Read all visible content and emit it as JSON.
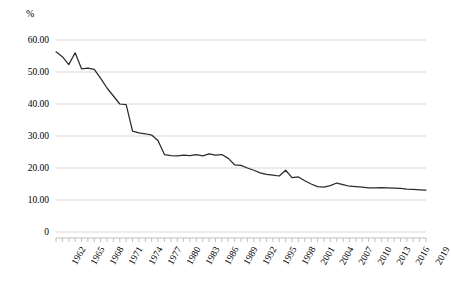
{
  "chart": {
    "unit_label": "%",
    "axis": {
      "y_ticks": [
        "0",
        "10.00",
        "20.00",
        "30.00",
        "40.00",
        "50.00",
        "60.00"
      ],
      "x_ticks": [
        "1962",
        "1965",
        "1968",
        "1971",
        "1974",
        "1977",
        "1980",
        "1983",
        "1986",
        "1989",
        "1992",
        "1995",
        "1998",
        "2001",
        "2004",
        "2007",
        "2010",
        "2013",
        "2016",
        "2019"
      ]
    },
    "line_color": "#2b2b2b",
    "grid_color": "#d9d9d9",
    "axis_color": "#bfbfbf"
  },
  "chart_data": {
    "type": "line",
    "title": "",
    "xlabel": "",
    "ylabel": "%",
    "ylim": [
      0,
      60
    ],
    "xlim": [
      1962,
      2020
    ],
    "grid": true,
    "legend": false,
    "y_tick_values": [
      0,
      10,
      20,
      30,
      40,
      50,
      60
    ],
    "x_tick_labels": [
      "1962",
      "1965",
      "1968",
      "1971",
      "1974",
      "1977",
      "1980",
      "1983",
      "1986",
      "1989",
      "1992",
      "1995",
      "1998",
      "2001",
      "2004",
      "2007",
      "2010",
      "2013",
      "2016",
      "2019"
    ],
    "x": [
      1962,
      1963,
      1964,
      1965,
      1966,
      1967,
      1968,
      1969,
      1970,
      1971,
      1972,
      1973,
      1974,
      1975,
      1976,
      1977,
      1978,
      1979,
      1980,
      1981,
      1982,
      1983,
      1984,
      1985,
      1986,
      1987,
      1988,
      1989,
      1990,
      1991,
      1992,
      1993,
      1994,
      1995,
      1996,
      1997,
      1998,
      1999,
      2000,
      2001,
      2002,
      2003,
      2004,
      2005,
      2006,
      2007,
      2008,
      2009,
      2010,
      2011,
      2012,
      2013,
      2014,
      2015,
      2016,
      2017,
      2018,
      2019,
      2020
    ],
    "series": [
      {
        "name": "Share",
        "values": [
          56.3,
          54.8,
          52.3,
          56.0,
          51.0,
          51.2,
          50.8,
          48.0,
          45.0,
          42.5,
          40.0,
          39.8,
          31.5,
          31.0,
          30.7,
          30.3,
          28.5,
          24.2,
          23.9,
          23.8,
          24.0,
          23.9,
          24.2,
          23.8,
          24.4,
          24.0,
          24.2,
          23.0,
          21.0,
          20.8,
          20.0,
          19.3,
          18.5,
          18.0,
          17.8,
          17.5,
          19.3,
          17.0,
          17.2,
          16.0,
          15.0,
          14.2,
          14.0,
          14.5,
          15.3,
          14.8,
          14.3,
          14.2,
          14.0,
          13.8,
          13.8,
          13.9,
          13.8,
          13.7,
          13.6,
          13.4,
          13.3,
          13.2,
          13.1
        ]
      }
    ]
  }
}
